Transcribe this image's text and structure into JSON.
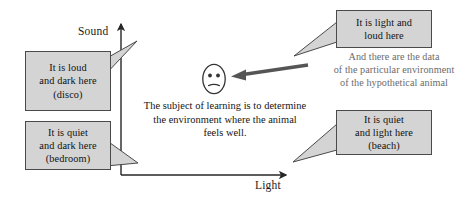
{
  "diagram": {
    "axes": {
      "y_label": "Sound",
      "x_label": "Light"
    },
    "callouts": [
      {
        "name": "disco",
        "lines": [
          "It is loud",
          "and dark here",
          "(disco)"
        ]
      },
      {
        "name": "bedroom",
        "lines": [
          "It is quiet",
          "and dark here",
          "(bedroom)"
        ]
      },
      {
        "name": "light-and-loud",
        "lines": [
          "It is light and",
          "loud here"
        ]
      },
      {
        "name": "beach",
        "lines": [
          "It is quiet",
          "and light here",
          "(beach)"
        ]
      }
    ],
    "caption": {
      "lines": [
        "The subject of learning is to determine",
        "the environment where the animal",
        "feels well."
      ]
    },
    "annotation": {
      "lines": [
        "And there are the data",
        "of the particular environment",
        "of the hypothetical animal"
      ]
    },
    "face": {
      "expression": "neutral-face"
    },
    "colors": {
      "box_fill": "#d4d4d4",
      "box_stroke": "#4a4a4a",
      "axis": "#262626",
      "arrow": "#555555",
      "annotation_text": "#6b6b6b",
      "body_text": "#141414"
    }
  }
}
